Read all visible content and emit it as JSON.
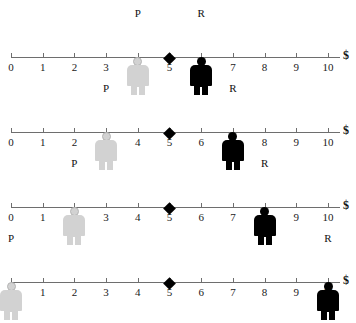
{
  "chart_data": {
    "type": "scatter",
    "title": "",
    "xlabel": "$",
    "ylabel": "",
    "xlim": [
      0,
      10
    ],
    "grid": false,
    "legend": null,
    "axis": {
      "tick_labels": [
        "0",
        "1",
        "2",
        "3",
        "4",
        "5",
        "6",
        "7",
        "8",
        "9",
        "10"
      ],
      "tick_values": [
        0,
        1,
        2,
        3,
        4,
        5,
        6,
        7,
        8,
        9,
        10
      ],
      "end_label": "$",
      "marker_value": 5,
      "marker_name": "diamond-marker"
    },
    "series": [
      {
        "name": "P",
        "values": [
          4,
          3,
          2,
          0
        ],
        "color": "#d2d2d2",
        "style": "light-person-icon"
      },
      {
        "name": "R",
        "values": [
          6,
          7,
          8,
          10
        ],
        "color": "#000000",
        "style": "dark-person-icon"
      }
    ],
    "rows": [
      {
        "index": 1,
        "p_label": "P",
        "p_value": 4,
        "r_label": "R",
        "r_value": 6,
        "marker_value": 5,
        "currency": "$",
        "ticks": [
          "0",
          "1",
          "2",
          "3",
          "4",
          "5",
          "6",
          "7",
          "8",
          "9",
          "10"
        ]
      },
      {
        "index": 2,
        "p_label": "P",
        "p_value": 3,
        "r_label": "R",
        "r_value": 7,
        "marker_value": 5,
        "currency": "$",
        "ticks": [
          "0",
          "1",
          "2",
          "3",
          "4",
          "5",
          "6",
          "7",
          "8",
          "9",
          "10"
        ]
      },
      {
        "index": 3,
        "p_label": "P",
        "p_value": 2,
        "r_label": "R",
        "r_value": 8,
        "marker_value": 5,
        "currency": "$",
        "ticks": [
          "0",
          "1",
          "2",
          "3",
          "4",
          "5",
          "6",
          "7",
          "8",
          "9",
          "10"
        ]
      },
      {
        "index": 4,
        "p_label": "P",
        "p_value": 0,
        "r_label": "R",
        "r_value": 10,
        "marker_value": 5,
        "currency": "$",
        "ticks": [
          "0",
          "1",
          "2",
          "3",
          "4",
          "5",
          "6",
          "7",
          "8",
          "9",
          "10"
        ]
      }
    ]
  },
  "caption": ""
}
